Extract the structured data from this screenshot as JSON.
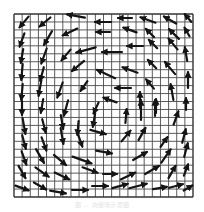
{
  "figure": {
    "type": "vector-field",
    "grid": {
      "x0": 14,
      "y0": 14,
      "x1": 193,
      "y1": 197,
      "cols": 22,
      "rows": 23,
      "line_color": "#4a4a4a",
      "border_color": "#333333"
    },
    "arrow_color": "#151515",
    "background": "#ffffff",
    "arrows": [
      {
        "x": 24,
        "y": 22,
        "a": 130,
        "l": 14
      },
      {
        "x": 45,
        "y": 22,
        "a": 140,
        "l": 14
      },
      {
        "x": 76,
        "y": 16,
        "a": 190,
        "l": 18
      },
      {
        "x": 103,
        "y": 22,
        "a": 180,
        "l": 16
      },
      {
        "x": 125,
        "y": 18,
        "a": 180,
        "l": 14
      },
      {
        "x": 148,
        "y": 20,
        "a": 200,
        "l": 16
      },
      {
        "x": 170,
        "y": 20,
        "a": 210,
        "l": 14
      },
      {
        "x": 188,
        "y": 18,
        "a": 230,
        "l": 10
      },
      {
        "x": 22,
        "y": 40,
        "a": 110,
        "l": 14
      },
      {
        "x": 48,
        "y": 38,
        "a": 120,
        "l": 16
      },
      {
        "x": 70,
        "y": 32,
        "a": 155,
        "l": 16
      },
      {
        "x": 103,
        "y": 32,
        "a": 180,
        "l": 14
      },
      {
        "x": 130,
        "y": 30,
        "a": 200,
        "l": 14
      },
      {
        "x": 150,
        "y": 33,
        "a": 225,
        "l": 12
      },
      {
        "x": 174,
        "y": 34,
        "a": 225,
        "l": 14
      },
      {
        "x": 187,
        "y": 32,
        "a": 240,
        "l": 10
      },
      {
        "x": 22,
        "y": 56,
        "a": 100,
        "l": 14
      },
      {
        "x": 44,
        "y": 56,
        "a": 110,
        "l": 16
      },
      {
        "x": 66,
        "y": 55,
        "a": 130,
        "l": 14
      },
      {
        "x": 86,
        "y": 50,
        "a": 165,
        "l": 20
      },
      {
        "x": 112,
        "y": 52,
        "a": 180,
        "l": 20
      },
      {
        "x": 135,
        "y": 46,
        "a": 180,
        "l": 16
      },
      {
        "x": 153,
        "y": 44,
        "a": 225,
        "l": 12
      },
      {
        "x": 173,
        "y": 44,
        "a": 230,
        "l": 14
      },
      {
        "x": 186,
        "y": 54,
        "a": 260,
        "l": 14
      },
      {
        "x": 22,
        "y": 72,
        "a": 95,
        "l": 16
      },
      {
        "x": 42,
        "y": 74,
        "a": 105,
        "l": 14
      },
      {
        "x": 78,
        "y": 66,
        "a": 140,
        "l": 16
      },
      {
        "x": 106,
        "y": 74,
        "a": 205,
        "l": 20
      },
      {
        "x": 130,
        "y": 70,
        "a": 200,
        "l": 16
      },
      {
        "x": 152,
        "y": 64,
        "a": 225,
        "l": 12
      },
      {
        "x": 170,
        "y": 68,
        "a": 230,
        "l": 16
      },
      {
        "x": 188,
        "y": 80,
        "a": 270,
        "l": 16
      },
      {
        "x": 22,
        "y": 92,
        "a": 95,
        "l": 16
      },
      {
        "x": 40,
        "y": 88,
        "a": 100,
        "l": 16
      },
      {
        "x": 60,
        "y": 90,
        "a": 110,
        "l": 16
      },
      {
        "x": 84,
        "y": 86,
        "a": 125,
        "l": 12
      },
      {
        "x": 123,
        "y": 88,
        "a": 180,
        "l": 16
      },
      {
        "x": 150,
        "y": 84,
        "a": 230,
        "l": 12
      },
      {
        "x": 172,
        "y": 92,
        "a": 260,
        "l": 16
      },
      {
        "x": 22,
        "y": 108,
        "a": 90,
        "l": 14
      },
      {
        "x": 42,
        "y": 106,
        "a": 100,
        "l": 14
      },
      {
        "x": 66,
        "y": 108,
        "a": 105,
        "l": 16
      },
      {
        "x": 96,
        "y": 108,
        "a": 115,
        "l": 12
      },
      {
        "x": 110,
        "y": 100,
        "a": 200,
        "l": 14
      },
      {
        "x": 140,
        "y": 100,
        "a": 270,
        "l": 16
      },
      {
        "x": 155,
        "y": 108,
        "a": 270,
        "l": 16
      },
      {
        "x": 186,
        "y": 104,
        "a": 270,
        "l": 12
      },
      {
        "x": 24,
        "y": 126,
        "a": 80,
        "l": 16
      },
      {
        "x": 44,
        "y": 126,
        "a": 75,
        "l": 14
      },
      {
        "x": 62,
        "y": 122,
        "a": 80,
        "l": 14
      },
      {
        "x": 78,
        "y": 128,
        "a": 95,
        "l": 14
      },
      {
        "x": 94,
        "y": 120,
        "a": 100,
        "l": 14
      },
      {
        "x": 126,
        "y": 116,
        "a": 275,
        "l": 14
      },
      {
        "x": 141,
        "y": 110,
        "a": 270,
        "l": 20
      },
      {
        "x": 156,
        "y": 106,
        "a": 270,
        "l": 14
      },
      {
        "x": 176,
        "y": 118,
        "a": 290,
        "l": 14
      },
      {
        "x": 24,
        "y": 142,
        "a": 75,
        "l": 14
      },
      {
        "x": 44,
        "y": 144,
        "a": 70,
        "l": 14
      },
      {
        "x": 62,
        "y": 136,
        "a": 80,
        "l": 16
      },
      {
        "x": 80,
        "y": 140,
        "a": 70,
        "l": 14
      },
      {
        "x": 98,
        "y": 132,
        "a": 15,
        "l": 16
      },
      {
        "x": 126,
        "y": 136,
        "a": 310,
        "l": 14
      },
      {
        "x": 142,
        "y": 134,
        "a": 300,
        "l": 14
      },
      {
        "x": 164,
        "y": 142,
        "a": 305,
        "l": 12
      },
      {
        "x": 184,
        "y": 136,
        "a": 285,
        "l": 14
      },
      {
        "x": 24,
        "y": 158,
        "a": 70,
        "l": 14
      },
      {
        "x": 40,
        "y": 156,
        "a": 60,
        "l": 16
      },
      {
        "x": 60,
        "y": 160,
        "a": 40,
        "l": 16
      },
      {
        "x": 82,
        "y": 160,
        "a": 20,
        "l": 20
      },
      {
        "x": 104,
        "y": 152,
        "a": 10,
        "l": 16
      },
      {
        "x": 140,
        "y": 156,
        "a": 330,
        "l": 16
      },
      {
        "x": 166,
        "y": 156,
        "a": 305,
        "l": 16
      },
      {
        "x": 186,
        "y": 150,
        "a": 285,
        "l": 14
      },
      {
        "x": 22,
        "y": 172,
        "a": 60,
        "l": 14
      },
      {
        "x": 42,
        "y": 172,
        "a": 35,
        "l": 16
      },
      {
        "x": 62,
        "y": 176,
        "a": 25,
        "l": 16
      },
      {
        "x": 90,
        "y": 170,
        "a": 20,
        "l": 16
      },
      {
        "x": 110,
        "y": 174,
        "a": 0,
        "l": 14
      },
      {
        "x": 128,
        "y": 176,
        "a": 335,
        "l": 16
      },
      {
        "x": 152,
        "y": 170,
        "a": 330,
        "l": 16
      },
      {
        "x": 172,
        "y": 172,
        "a": 300,
        "l": 14
      },
      {
        "x": 186,
        "y": 170,
        "a": 290,
        "l": 12
      },
      {
        "x": 22,
        "y": 188,
        "a": 20,
        "l": 14
      },
      {
        "x": 40,
        "y": 186,
        "a": 30,
        "l": 14
      },
      {
        "x": 58,
        "y": 192,
        "a": 10,
        "l": 16
      },
      {
        "x": 80,
        "y": 190,
        "a": 0,
        "l": 16
      },
      {
        "x": 100,
        "y": 186,
        "a": 0,
        "l": 16
      },
      {
        "x": 120,
        "y": 186,
        "a": 345,
        "l": 16
      },
      {
        "x": 138,
        "y": 186,
        "a": 345,
        "l": 18
      },
      {
        "x": 160,
        "y": 188,
        "a": 350,
        "l": 14
      },
      {
        "x": 176,
        "y": 186,
        "a": 345,
        "l": 14
      },
      {
        "x": 188,
        "y": 188,
        "a": 330,
        "l": 10
      }
    ]
  },
  "caption": {
    "text": "图 … 向量场示意图"
  }
}
